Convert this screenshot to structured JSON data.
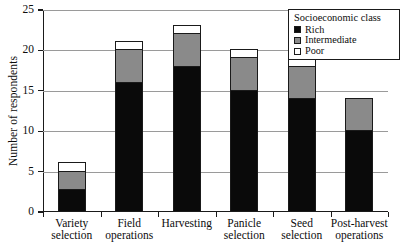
{
  "chart_data": {
    "type": "bar",
    "stacked": true,
    "title": "",
    "xlabel": "",
    "ylabel": "Number of respondents",
    "ylim": [
      0,
      25
    ],
    "yticks": [
      0,
      5,
      10,
      15,
      20,
      25
    ],
    "grid": true,
    "legend_position": "top-right",
    "legend_title": "Socioeconomic class",
    "categories": [
      "Variety selection",
      "Field operations",
      "Harvesting",
      "Panicle selection",
      "Seed selection",
      "Post-harvest operations"
    ],
    "category_lines": [
      [
        "Variety",
        "selection"
      ],
      [
        "Field",
        "operations"
      ],
      [
        "Harvesting",
        ""
      ],
      [
        "Panicle",
        "selection"
      ],
      [
        "Seed",
        "selection"
      ],
      [
        "Post-harvest",
        "operations"
      ]
    ],
    "series": [
      {
        "name": "Rich",
        "color": "#0a0a0a",
        "values": [
          2.7,
          16,
          18,
          15,
          14,
          10
        ]
      },
      {
        "name": "Intermediate",
        "color": "#8a8a8a",
        "values": [
          2.3,
          4,
          4,
          4,
          4,
          4
        ]
      },
      {
        "name": "Poor",
        "color": "#ffffff",
        "values": [
          1,
          1,
          1,
          1,
          1,
          0
        ]
      }
    ],
    "totals": [
      6,
      21,
      23,
      20,
      19,
      14
    ]
  },
  "legend": {
    "title": "Socioeconomic class",
    "items": [
      {
        "label": "Rich",
        "swatch": "rich-swatch"
      },
      {
        "label": "Intermediate",
        "swatch": "intermediate-swatch"
      },
      {
        "label": "Poor",
        "swatch": "poor-swatch"
      }
    ]
  },
  "axes": {
    "y_title": "Number of respondents",
    "y_tick_labels": [
      "25",
      "20",
      "15",
      "10",
      "5",
      "0"
    ]
  }
}
